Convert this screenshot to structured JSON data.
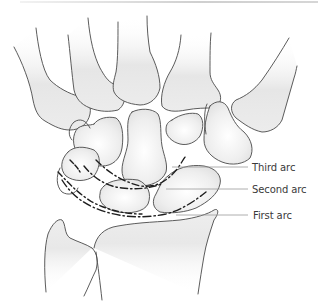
{
  "figure": {
    "labels": {
      "third_arc": "Third arc",
      "second_arc": "Second arc",
      "first_arc": "First arc"
    },
    "colors": {
      "outline": "#4a4a4a",
      "arc_dash": "#1e1e1e",
      "leader_line": "#9a9a9a",
      "bone_shade": "#e4e4e4",
      "label_text": "#3a3a3a"
    }
  }
}
